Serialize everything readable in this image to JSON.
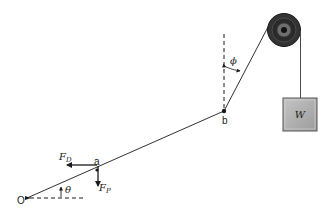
{
  "diagram": {
    "type": "free-body / pulley system",
    "points": {
      "origin": {
        "label": "O",
        "x": 27,
        "y": 198
      },
      "a": {
        "label": "a",
        "x": 97,
        "y": 170
      },
      "b": {
        "label": "b",
        "x": 224,
        "y": 111
      }
    },
    "angles": {
      "theta": {
        "label": "θ"
      },
      "phi": {
        "label": "ϕ"
      }
    },
    "forces": {
      "drag": {
        "label": "F",
        "subscript": "D",
        "direction": "left"
      },
      "pull": {
        "label": "F",
        "subscript": "P",
        "direction": "down"
      }
    },
    "weight": {
      "label": "W",
      "fill": "#b3b3b3"
    },
    "pulley": {
      "outer_color": "#3a3a3a",
      "ring_color": "#6e6e6e",
      "hub_color": "#111111"
    },
    "line_color": "#1a1a1a"
  }
}
